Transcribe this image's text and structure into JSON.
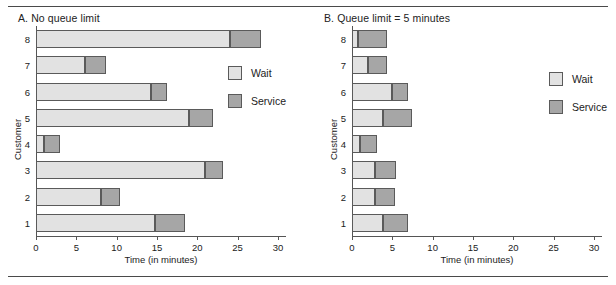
{
  "figure": {
    "ylabel": "Customer",
    "xlabel": "Time (in minutes)",
    "legend": {
      "wait_label": "Wait",
      "service_label": "Service",
      "wait_color": "#e2e2e2",
      "service_color": "#a6a6a6"
    }
  },
  "chart_data": [
    {
      "type": "bar",
      "title": "A. No queue limit",
      "orientation": "horizontal",
      "stacked": true,
      "xlabel": "Time (in minutes)",
      "ylabel": "Customer",
      "xlim": [
        0,
        31
      ],
      "xticks": [
        0,
        5,
        10,
        15,
        20,
        25,
        30
      ],
      "xtick_labels": [
        "0",
        "5",
        "10",
        "15",
        "20",
        "25",
        "30"
      ],
      "grid": false,
      "legend_position": "right",
      "categories": [
        "1",
        "2",
        "3",
        "4",
        "5",
        "6",
        "7",
        "8"
      ],
      "series": [
        {
          "name": "Wait",
          "values": [
            14.8,
            8.0,
            21.0,
            1.0,
            19.0,
            14.3,
            6.1,
            24.0
          ]
        },
        {
          "name": "Service",
          "values": [
            3.7,
            2.4,
            2.2,
            2.0,
            3.0,
            2.0,
            2.6,
            3.9
          ]
        }
      ],
      "totals": [
        18.5,
        10.4,
        23.2,
        3.0,
        22.0,
        16.3,
        8.7,
        27.9
      ]
    },
    {
      "type": "bar",
      "title": "B. Queue limit = 5 minutes",
      "orientation": "horizontal",
      "stacked": true,
      "xlabel": "Time (in minutes)",
      "ylabel": "Customer",
      "xlim": [
        0,
        31
      ],
      "xticks": [
        0,
        5,
        10,
        15,
        20,
        25,
        30
      ],
      "xtick_labels": [
        "0",
        "5",
        "10",
        "15",
        "20",
        "25",
        "30"
      ],
      "grid": false,
      "legend_position": "right",
      "categories": [
        "1",
        "2",
        "3",
        "4",
        "5",
        "6",
        "7",
        "8"
      ],
      "series": [
        {
          "name": "Wait",
          "values": [
            3.9,
            2.9,
            2.9,
            1.0,
            3.9,
            5.0,
            2.0,
            0.7
          ]
        },
        {
          "name": "Service",
          "values": [
            3.0,
            2.4,
            2.5,
            2.1,
            3.6,
            2.0,
            2.3,
            3.6
          ]
        }
      ],
      "totals": [
        6.9,
        5.3,
        5.4,
        3.1,
        7.5,
        7.0,
        4.3,
        4.3
      ]
    }
  ]
}
